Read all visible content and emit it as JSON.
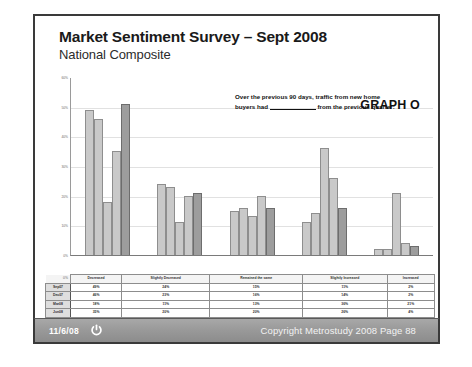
{
  "slide": {
    "title": "Market Sentiment Survey – Sept 2008",
    "subtitle": "National Composite",
    "graph_label": "GRAPH O",
    "callout_part1": "Over the previous 90 days, traffic from new home",
    "callout_part2": "buyers had",
    "callout_part3": "from the previous quarter:"
  },
  "footer": {
    "date": "11/6/08",
    "power_icon": "power-icon",
    "copyright": "Copyright Metrostudy 2008  Page 88"
  },
  "chart_data": {
    "type": "bar",
    "title": "Market Sentiment Survey – Sept 2008",
    "subtitle": "National Composite",
    "xlabel": "",
    "ylabel": "",
    "ylim": [
      0,
      60
    ],
    "grid": true,
    "legend_position": "none",
    "annotation": "Over the previous 90 days, traffic from new home buyers had ______ from the previous quarter:",
    "ytick_labels": [
      "60%",
      "50%",
      "40%",
      "30%",
      "20%",
      "10%",
      "0%"
    ],
    "ytick_values": [
      60,
      50,
      40,
      30,
      20,
      10,
      0
    ],
    "categories": [
      "Decreased",
      "Slightly Decreased",
      "Remained the same",
      "Slightly Increased",
      "Increased"
    ],
    "series": [
      {
        "name": "Sep07",
        "values": [
          49,
          24,
          15,
          11,
          2
        ]
      },
      {
        "name": "Dec07",
        "values": [
          46,
          23,
          16,
          14,
          2
        ]
      },
      {
        "name": "Mar08",
        "values": [
          18,
          11,
          13,
          36,
          21
        ]
      },
      {
        "name": "Jun08",
        "values": [
          35,
          20,
          20,
          26,
          4
        ]
      },
      {
        "name": "Sep08",
        "values": [
          51,
          21,
          16,
          16,
          3
        ]
      }
    ]
  },
  "table": {
    "corner": "0%",
    "headers": [
      "Decreased",
      "Slightly Decreased",
      "Remained the same",
      "Slightly Increased",
      "Increased"
    ],
    "rows": [
      {
        "label": "Sep07",
        "cells": [
          "49%",
          "24%",
          "15%",
          "11%",
          "2%"
        ]
      },
      {
        "label": "Dec07",
        "cells": [
          "46%",
          "23%",
          "16%",
          "14%",
          "2%"
        ]
      },
      {
        "label": "Mar08",
        "cells": [
          "18%",
          "11%",
          "13%",
          "36%",
          "21%"
        ]
      },
      {
        "label": "Jun08",
        "cells": [
          "35%",
          "20%",
          "20%",
          "26%",
          "4%"
        ]
      },
      {
        "label": "Sep08",
        "cells": [
          "51%",
          "21%",
          "16%",
          "16%",
          "3%"
        ]
      }
    ]
  }
}
